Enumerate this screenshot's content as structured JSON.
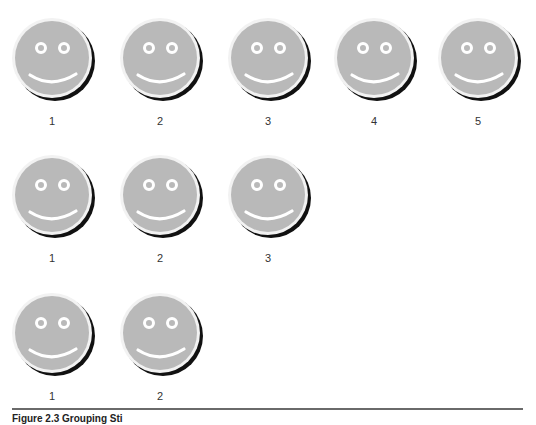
{
  "figure": {
    "rows": [
      {
        "label_ids": [
          "1",
          "2",
          "3",
          "4",
          "5"
        ],
        "count": 5
      },
      {
        "label_ids": [
          "1",
          "2",
          "3"
        ],
        "count": 3
      },
      {
        "label_ids": [
          "1",
          "2"
        ],
        "count": 2
      }
    ],
    "caption": "Figure 2.3 Grouping Sti",
    "colors": {
      "face_fill": "#b9b9b9",
      "face_rim": "#f2f2f2",
      "shadow": "#111111",
      "features": "#ffffff",
      "divider": "#6a6a6a"
    }
  }
}
